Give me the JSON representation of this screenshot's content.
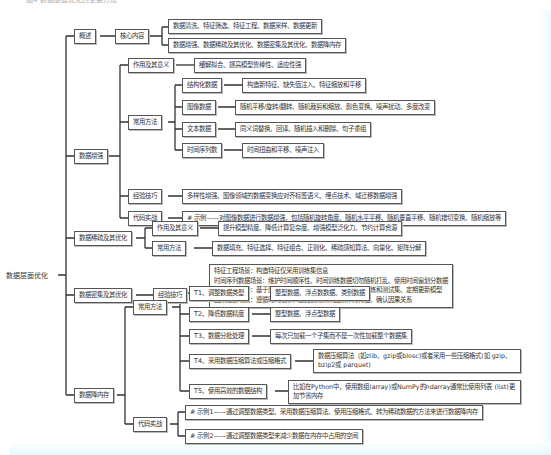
{
  "root": "数据层面优化",
  "top_cut_text": "图4 数据层面优化的主要方法",
  "overview": {
    "label": "概述",
    "core": "核心内容",
    "items": [
      "数据清洗、特征筛选、特征工程、数据采样、数据更新",
      "数据增强、数据稀疏及其优化、数据密集及其优化、数据降内存"
    ]
  },
  "augmentation": {
    "label": "数据增强",
    "purpose_label": "作用及其意义",
    "purpose": "缓解拟合、提高模型鲁棒性、适应性强",
    "methods_label": "常用方法",
    "methods": [
      {
        "label": "结构化数据",
        "detail": "构造新特征、缺失值注入、特征缩放和平移"
      },
      {
        "label": "图像数据",
        "detail": "随机平移/旋转/翻转、随机裁剪和缩放、颜色变换、噪声扰动、多度改变"
      },
      {
        "label": "文本数据",
        "detail": "同义词替换、回译、随机插入和删除、句子重组"
      },
      {
        "label": "时间序列数",
        "detail": "时间扭曲和平移、噪声注入"
      }
    ],
    "tips_label": "经验技巧",
    "tips": "多样性增强、图像领域的数据变换应对齐标签语义、埋点技术、域迁移数据增强",
    "code_label": "代码实战",
    "code": "# 示例——对图像数据进行数据增强，包括随机旋转角度、随机水平平移、随机垂直平移、随机错切变换、随机缩放等"
  },
  "sparse": {
    "label": "数据稀疏及其优化",
    "purpose_label": "作用及其意义",
    "purpose": "提升模型精度、降低计算复杂度、增强模型泛化力、节约计算资源",
    "methods_label": "常用方法",
    "methods": "数据填充、特征选择、特征组合、正则化、稀疏感知算法、向量化、矩阵分解"
  },
  "dense": {
    "label": "数据密集及其优化",
    "tips_label": "经验技巧",
    "tips": [
      "特征工程场景：构造特征仅采用训练集信息",
      "时间序列数据场景：维护时间顺序性、时间训练数据切勿随机打乱、使用时间窗划分数据",
      "推荐系统场景：基于历史行为训练、使用时间戳严格划分训练和测试集、定期更新模型",
      "因果推断场景：遵循时间顺序、避免使用未来结果作为特征、确认因果关系"
    ]
  },
  "memory": {
    "label": "数据降内存",
    "methods_label": "常用方法",
    "methods": [
      {
        "label": "T1、调整数据类型",
        "detail": "整型数据、浮点数数据、类别数据"
      },
      {
        "label": "T2、降低数据精度",
        "detail": "整型数据、浮点型数据"
      },
      {
        "label": "T3、数据分批处理",
        "detail": "每次只加载一个子集而不是一次性加载整个数据集"
      },
      {
        "label": "T4、采用数据压缩算法或压缩格式",
        "detail": "数据压缩算法（如zlib、gzip或blosc)或者采用一些压缩格式(如 gzip、bzip2或 parquet)"
      },
      {
        "label": "T5、使用高效的数据结构",
        "detail": "比如在Python中，使用数组(array)或NumPy的ndarray通常比使用列表 (list)更加节省内存"
      }
    ],
    "code_label": "代码实战",
    "code": [
      "# 示例1——通过调整数据类型、采用数据压缩算法、使用压缩格式、转为稀疏数据的方法来进行数据降内存",
      "# 示例2——通过调整数据类型来减少数据在内存中占用的空间"
    ]
  }
}
